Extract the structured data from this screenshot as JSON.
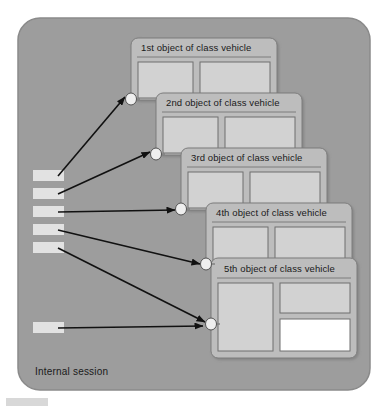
{
  "diagram": {
    "title": "Internal session",
    "container": {
      "label": "Internal session",
      "fill": "#9d9d9d",
      "stroke": "#8a8a8a"
    },
    "colors": {
      "canvas": "#ffffff",
      "container_fill": "#9d9d9d",
      "card_fill": "#bdbdbd",
      "card_stroke": "#7d7d7d",
      "panel_fill": "#d2d2d2",
      "panel_stroke": "#6f6f6f",
      "panel_white": "#ffffff",
      "slot_fill": "#e2e2e2",
      "port_fill": "#eeeeee",
      "arrow": "#111111",
      "text": "#1a1a1a",
      "artifact": "#d8d8d8"
    },
    "cards": [
      {
        "id": "card-1",
        "title": "1st object of class vehicle",
        "x": 131,
        "y": 38,
        "w": 146,
        "h": 62,
        "title_x": 141,
        "title_y": 50,
        "rule_y": 57,
        "panels": [
          {
            "x": 138,
            "y": 62,
            "w": 55,
            "h": 36,
            "fill": "#d2d2d2"
          },
          {
            "x": 200,
            "y": 62,
            "w": 70,
            "h": 36,
            "fill": "#d2d2d2"
          }
        ],
        "port": {
          "cx": 131,
          "cy": 99,
          "rx": 5.5,
          "ry": 6
        }
      },
      {
        "id": "card-2",
        "title": "2nd object of class vehicle",
        "x": 156,
        "y": 93,
        "w": 146,
        "h": 62,
        "title_x": 166,
        "title_y": 105,
        "rule_y": 112,
        "panels": [
          {
            "x": 163,
            "y": 117,
            "w": 55,
            "h": 36,
            "fill": "#d2d2d2"
          },
          {
            "x": 225,
            "y": 117,
            "w": 70,
            "h": 36,
            "fill": "#d2d2d2"
          }
        ],
        "port": {
          "cx": 156,
          "cy": 154,
          "rx": 5.5,
          "ry": 6
        }
      },
      {
        "id": "card-3",
        "title": "3rd object of class vehicle",
        "x": 181,
        "y": 148,
        "w": 146,
        "h": 62,
        "title_x": 191,
        "title_y": 160,
        "rule_y": 167,
        "panels": [
          {
            "x": 188,
            "y": 172,
            "w": 55,
            "h": 36,
            "fill": "#d2d2d2"
          },
          {
            "x": 250,
            "y": 172,
            "w": 70,
            "h": 36,
            "fill": "#d2d2d2"
          }
        ],
        "port": {
          "cx": 181,
          "cy": 209,
          "rx": 5.5,
          "ry": 6
        }
      },
      {
        "id": "card-4",
        "title": "4th object of class vehicle",
        "x": 206,
        "y": 203,
        "w": 146,
        "h": 62,
        "title_x": 216,
        "title_y": 215,
        "rule_y": 222,
        "panels": [
          {
            "x": 213,
            "y": 227,
            "w": 55,
            "h": 36,
            "fill": "#d2d2d2"
          },
          {
            "x": 275,
            "y": 227,
            "w": 70,
            "h": 36,
            "fill": "#d2d2d2"
          }
        ],
        "port": {
          "cx": 206,
          "cy": 264,
          "rx": 5.5,
          "ry": 6
        }
      },
      {
        "id": "card-5",
        "title": "5th object of class vehicle",
        "x": 211,
        "y": 258,
        "w": 146,
        "h": 100,
        "title_x": 224,
        "title_y": 271,
        "rule_y": 278,
        "panels": [
          {
            "x": 218,
            "y": 283,
            "w": 55,
            "h": 68,
            "fill": "#d2d2d2"
          },
          {
            "x": 280,
            "y": 283,
            "w": 70,
            "h": 30,
            "fill": "#d2d2d2"
          },
          {
            "x": 280,
            "y": 319,
            "w": 70,
            "h": 32,
            "fill": "#ffffff"
          }
        ],
        "port": {
          "cx": 211,
          "cy": 324,
          "rx": 5.5,
          "ry": 6
        }
      }
    ],
    "slots": [
      {
        "id": "slot-1",
        "x": 33,
        "y": 170,
        "w": 31,
        "h": 11
      },
      {
        "id": "slot-2",
        "x": 33,
        "y": 188,
        "w": 31,
        "h": 11
      },
      {
        "id": "slot-3",
        "x": 33,
        "y": 206,
        "w": 31,
        "h": 11
      },
      {
        "id": "slot-4",
        "x": 33,
        "y": 224,
        "w": 31,
        "h": 11
      },
      {
        "id": "slot-5",
        "x": 33,
        "y": 242,
        "w": 31,
        "h": 11
      },
      {
        "id": "slot-6",
        "x": 33,
        "y": 322,
        "w": 31,
        "h": 11
      }
    ],
    "arrows": [
      {
        "id": "arrow-slot1-to-card1",
        "from_slot": "slot-1",
        "x1": 58,
        "y1": 176,
        "x2": 125,
        "y2": 97
      },
      {
        "id": "arrow-slot2-to-card2",
        "from_slot": "slot-2",
        "x1": 58,
        "y1": 194,
        "x2": 150,
        "y2": 152
      },
      {
        "id": "arrow-slot3-to-card3",
        "from_slot": "slot-3",
        "x1": 58,
        "y1": 212,
        "x2": 175,
        "y2": 210
      },
      {
        "id": "arrow-slot4-to-card4",
        "from_slot": "slot-4",
        "x1": 58,
        "y1": 230,
        "x2": 200,
        "y2": 264
      },
      {
        "id": "arrow-slot5-to-card5",
        "from_slot": "slot-5",
        "x1": 58,
        "y1": 248,
        "x2": 205,
        "y2": 322
      },
      {
        "id": "arrow-slot6-to-card5",
        "from_slot": "slot-6",
        "x1": 58,
        "y1": 328,
        "x2": 203,
        "y2": 326
      }
    ],
    "artifact": {
      "x": 6,
      "y": 398,
      "w": 42,
      "h": 8
    }
  }
}
